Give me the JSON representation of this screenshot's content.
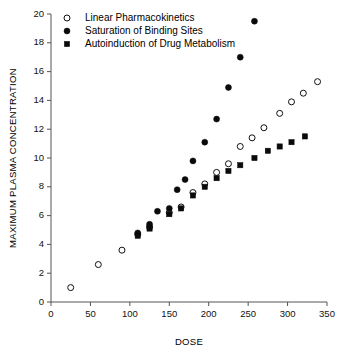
{
  "chart_data": {
    "type": "scatter",
    "title": "",
    "xlabel": "DOSE",
    "ylabel": "MAXIMUM PLASMA CONCENTRATION",
    "xlim": [
      0,
      350
    ],
    "ylim": [
      0,
      20
    ],
    "xticks": [
      0,
      50,
      100,
      150,
      200,
      250,
      300,
      350
    ],
    "yticks": [
      0,
      2,
      4,
      6,
      8,
      10,
      12,
      14,
      16,
      18,
      20
    ],
    "grid": false,
    "legend_position": "top-left",
    "series": [
      {
        "name": "Linear Pharmacokinetics",
        "marker": "open-circle",
        "color": "#111111",
        "points": [
          [
            25,
            1.0
          ],
          [
            60,
            2.6
          ],
          [
            90,
            3.6
          ],
          [
            110,
            4.7
          ],
          [
            125,
            5.2
          ],
          [
            150,
            6.2
          ],
          [
            165,
            6.6
          ],
          [
            180,
            7.6
          ],
          [
            195,
            8.2
          ],
          [
            210,
            9.0
          ],
          [
            225,
            9.6
          ],
          [
            240,
            10.8
          ],
          [
            255,
            11.4
          ],
          [
            270,
            12.1
          ],
          [
            290,
            13.1
          ],
          [
            305,
            13.9
          ],
          [
            320,
            14.5
          ],
          [
            338,
            15.3
          ]
        ]
      },
      {
        "name": "Saturation of Binding Sites",
        "marker": "filled-circle",
        "color": "#0a0a0a",
        "points": [
          [
            110,
            4.8
          ],
          [
            125,
            5.4
          ],
          [
            135,
            6.3
          ],
          [
            150,
            6.5
          ],
          [
            160,
            7.8
          ],
          [
            170,
            8.5
          ],
          [
            180,
            9.8
          ],
          [
            195,
            11.1
          ],
          [
            210,
            12.7
          ],
          [
            225,
            14.9
          ],
          [
            240,
            17.0
          ],
          [
            258,
            19.5
          ]
        ]
      },
      {
        "name": "Autoinduction of Drug Metabolism",
        "marker": "filled-square",
        "color": "#0a0a0a",
        "points": [
          [
            110,
            4.6
          ],
          [
            125,
            5.1
          ],
          [
            150,
            6.1
          ],
          [
            165,
            6.5
          ],
          [
            180,
            7.4
          ],
          [
            195,
            8.0
          ],
          [
            210,
            8.6
          ],
          [
            225,
            9.1
          ],
          [
            240,
            9.5
          ],
          [
            258,
            10.0
          ],
          [
            275,
            10.5
          ],
          [
            290,
            10.8
          ],
          [
            305,
            11.1
          ],
          [
            322,
            11.5
          ]
        ]
      }
    ]
  },
  "axes": {
    "x_title": "DOSE",
    "y_title": "MAXIMUM PLASMA CONCENTRATION"
  },
  "legend": {
    "items": [
      {
        "label": "Linear Pharmacokinetics",
        "marker": "open-circle"
      },
      {
        "label": "Saturation of Binding Sites",
        "marker": "filled-circle"
      },
      {
        "label": "Autoinduction of Drug Metabolism",
        "marker": "filled-square"
      }
    ]
  }
}
